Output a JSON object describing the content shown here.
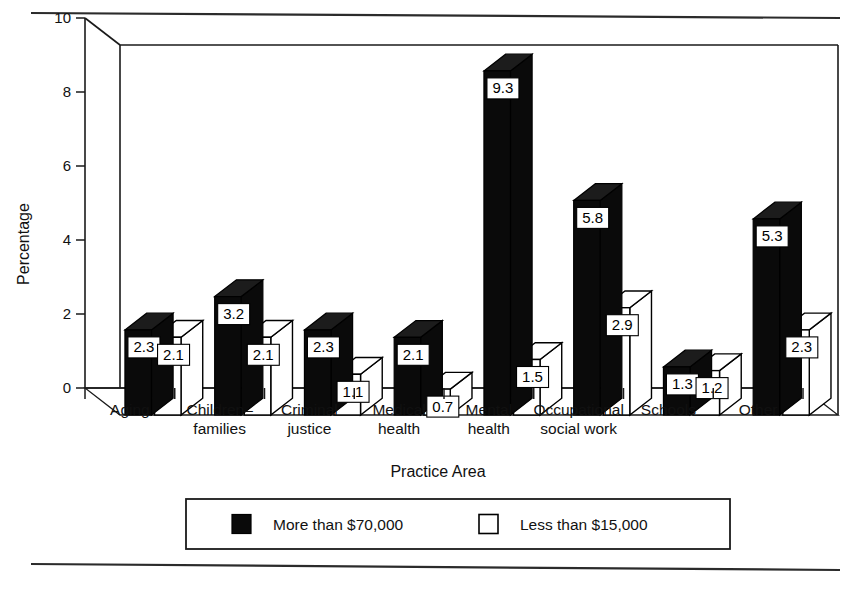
{
  "figure": {
    "top_rule": true,
    "bottom_rule": true
  },
  "chart_data": {
    "type": "bar",
    "title": "",
    "subtitle": "",
    "xlabel": "Practice Area",
    "ylabel": "Percentage",
    "ylim": [
      0,
      10
    ],
    "yticks": [
      "0",
      "2",
      "4",
      "6",
      "8",
      "10"
    ],
    "grid": false,
    "legend_position": "bottom",
    "three_d": true,
    "categories": [
      "Aging",
      "Children–\nfamilies",
      "Criminal\njustice",
      "Medical\nhealth",
      "Mental\nhealth",
      "Occupational\nsocial work",
      "Schools",
      "Other"
    ],
    "category_lines": [
      [
        "Aging",
        ""
      ],
      [
        "Children–",
        "families"
      ],
      [
        "Criminal",
        "justice"
      ],
      [
        "Medical",
        "health"
      ],
      [
        "Mental",
        "health"
      ],
      [
        "Occupational",
        "social work"
      ],
      [
        "Schools",
        ""
      ],
      [
        "Other",
        ""
      ]
    ],
    "series": [
      {
        "name": "More than $70,000",
        "color": "#0a0a0a",
        "values": [
          2.3,
          3.2,
          2.3,
          2.1,
          9.3,
          5.8,
          1.3,
          5.3
        ],
        "labels": [
          "2.3",
          "3.2",
          "2.3",
          "2.1",
          "9.3",
          "5.8",
          "1.3",
          "5.3"
        ]
      },
      {
        "name": "Less than $15,000",
        "color": "#ffffff",
        "values": [
          2.1,
          2.1,
          1.1,
          0.7,
          1.5,
          2.9,
          1.2,
          2.3
        ],
        "labels": [
          "2.1",
          "2.1",
          "1.1",
          "0.7",
          "1.5",
          "2.9",
          "1.2",
          "2.3"
        ]
      }
    ]
  },
  "legend": {
    "entries": [
      {
        "label": "More than $70,000",
        "swatch": "dark"
      },
      {
        "label": "Less than $15,000",
        "swatch": "light"
      }
    ]
  }
}
